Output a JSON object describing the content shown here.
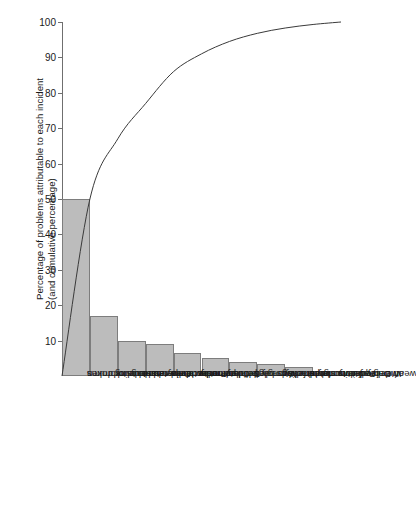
{
  "chart_data": {
    "type": "bar",
    "title": "",
    "subtitle": "",
    "xlabel": "",
    "ylabel_line1": "Percentage of problems attributable to each incident",
    "ylabel_line2": "(and cumulative percentage)",
    "ylim": [
      0,
      100
    ],
    "ytick_step": 10,
    "yticks": [
      0,
      10,
      20,
      30,
      40,
      50,
      60,
      70,
      80,
      90,
      100
    ],
    "ytick_labels": [
      "0",
      "10",
      "20",
      "30",
      "40",
      "50",
      "60",
      "70",
      "80",
      "90",
      "100"
    ],
    "grid": false,
    "legend": "none",
    "categories": [
      "Loss due to broken bags or drums",
      "Delay due to truck rescheduling",
      "Product delivered at too low temperature",
      "Customer received rusty drums",
      "Delivery not as per order",
      "Wrongly labelled product",
      "Imperfectly sealed drums or bags",
      "Pallet wrongly stacked for handling",
      "Wrong quantity stated on delivery documents",
      "Delay due to weather conditions"
    ],
    "category_lines": [
      [
        "Loss due to broken",
        "bags or drums"
      ],
      [
        "Delay due to truck",
        "rescheduling"
      ],
      [
        "Product delivered at",
        "too low temperature"
      ],
      [
        "Customer received",
        "rusty drums"
      ],
      [
        "Delivery not as",
        "per order"
      ],
      [
        "Wrongly labelled",
        "product"
      ],
      [
        "Imperfectly sealed",
        "drums or bags"
      ],
      [
        "Pallet wrongly stacked",
        "for handling"
      ],
      [
        "Wrong quantity stated",
        "on delivery documents"
      ],
      [
        "Delay due to",
        "weather conditions"
      ]
    ],
    "series": [
      {
        "name": "Percentage of problems attributable to each incident",
        "type": "bar",
        "values": [
          50,
          17,
          10,
          9,
          6.5,
          5,
          4,
          3.5,
          2.5,
          1.5
        ]
      },
      {
        "name": "Cumulative percentage",
        "type": "line",
        "values": [
          50,
          67,
          77,
          86,
          92.5,
          97.5,
          101.5,
          105,
          107.5,
          109
        ]
      }
    ],
    "cumulative_curve": [
      0,
      50,
      67,
      77,
      86,
      91,
      94.5,
      96.8,
      98.3,
      99.3,
      100
    ],
    "colors": {
      "bar_fill": "#bcbcbc",
      "bar_stroke": "#7d7d7d",
      "axis": "#6f6f6f",
      "curve": "#3a3a3a",
      "text": "#1a1a1a",
      "background": "#ffffff"
    }
  }
}
